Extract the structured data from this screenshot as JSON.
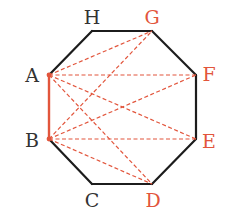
{
  "diagram": {
    "type": "regular-octagon",
    "colors": {
      "edge": "#1c1c1c",
      "highlight": "#e2553c",
      "black_label": "#333333",
      "red_label": "#e2553c"
    },
    "vertices": [
      {
        "name": "A",
        "x": 49,
        "y": 75,
        "highlight": false,
        "label": {
          "x": 32,
          "y": 82
        }
      },
      {
        "name": "B",
        "x": 49,
        "y": 139,
        "highlight": false,
        "label": {
          "x": 32,
          "y": 147
        }
      },
      {
        "name": "C",
        "x": 92,
        "y": 184,
        "highlight": false,
        "label": {
          "x": 92,
          "y": 207
        }
      },
      {
        "name": "D",
        "x": 152,
        "y": 184,
        "highlight": true,
        "label": {
          "x": 153,
          "y": 207
        }
      },
      {
        "name": "E",
        "x": 196,
        "y": 139,
        "highlight": true,
        "label": {
          "x": 209,
          "y": 148
        }
      },
      {
        "name": "F",
        "x": 196,
        "y": 75,
        "highlight": true,
        "label": {
          "x": 209,
          "y": 81
        }
      },
      {
        "name": "G",
        "x": 152,
        "y": 31,
        "highlight": true,
        "label": {
          "x": 152,
          "y": 24
        }
      },
      {
        "name": "H",
        "x": 92,
        "y": 31,
        "highlight": false,
        "label": {
          "x": 92,
          "y": 24
        }
      }
    ],
    "highlighted_edge": [
      "A",
      "B"
    ],
    "dashed_segments": [
      [
        "A",
        "G"
      ],
      [
        "A",
        "F"
      ],
      [
        "A",
        "E"
      ],
      [
        "A",
        "D"
      ],
      [
        "B",
        "G"
      ],
      [
        "B",
        "F"
      ],
      [
        "B",
        "E"
      ],
      [
        "B",
        "D"
      ]
    ]
  }
}
